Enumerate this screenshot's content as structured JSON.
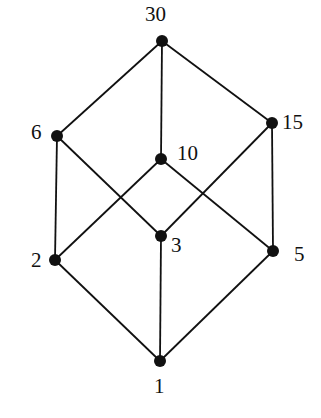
{
  "diagram": {
    "title": "",
    "type": "hasse-diagram",
    "colors": {
      "line": "#111111",
      "node": "#111111",
      "background": "#ffffff"
    },
    "nodes": [
      {
        "id": "n30",
        "label": "30",
        "x": 162,
        "y": 41,
        "lx": 145,
        "ly": 4
      },
      {
        "id": "n6",
        "label": "6",
        "x": 57,
        "y": 136,
        "lx": 31,
        "ly": 122
      },
      {
        "id": "n15",
        "label": "15",
        "x": 272,
        "y": 123,
        "lx": 282,
        "ly": 112
      },
      {
        "id": "n10",
        "label": "10",
        "x": 161,
        "y": 159,
        "lx": 177,
        "ly": 143
      },
      {
        "id": "n3",
        "label": "3",
        "x": 161,
        "y": 236,
        "lx": 171,
        "ly": 235
      },
      {
        "id": "n2",
        "label": "2",
        "x": 55,
        "y": 260,
        "lx": 31,
        "ly": 250
      },
      {
        "id": "n5",
        "label": "5",
        "x": 273,
        "y": 251,
        "lx": 294,
        "ly": 244
      },
      {
        "id": "n1",
        "label": "1",
        "x": 160,
        "y": 361,
        "lx": 154,
        "ly": 376
      }
    ],
    "edges": [
      [
        "n30",
        "n6"
      ],
      [
        "n30",
        "n10"
      ],
      [
        "n30",
        "n15"
      ],
      [
        "n6",
        "n2"
      ],
      [
        "n6",
        "n3"
      ],
      [
        "n10",
        "n2"
      ],
      [
        "n10",
        "n5"
      ],
      [
        "n15",
        "n3"
      ],
      [
        "n15",
        "n5"
      ],
      [
        "n2",
        "n1"
      ],
      [
        "n3",
        "n1"
      ],
      [
        "n5",
        "n1"
      ]
    ]
  }
}
